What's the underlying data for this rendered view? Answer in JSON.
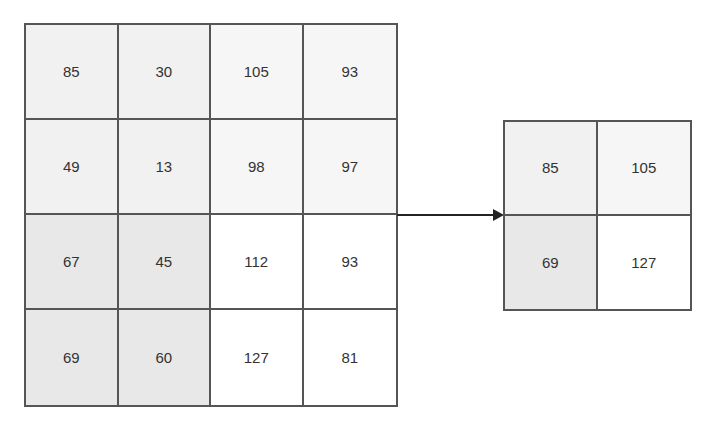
{
  "input_matrix": {
    "rows": [
      [
        85,
        30,
        105,
        93
      ],
      [
        49,
        13,
        98,
        97
      ],
      [
        67,
        45,
        112,
        93
      ],
      [
        69,
        60,
        127,
        81
      ]
    ],
    "quadrant_colors": {
      "top_left": "#f1f1f1",
      "top_right": "#f6f6f6",
      "bottom_left": "#e8e8e8",
      "bottom_right": "#ffffff"
    }
  },
  "output_matrix": {
    "rows": [
      [
        85,
        105
      ],
      [
        69,
        127
      ]
    ]
  },
  "arrow": {
    "direction": "right",
    "icon": "arrow-right-icon"
  },
  "border_color": "#555555"
}
